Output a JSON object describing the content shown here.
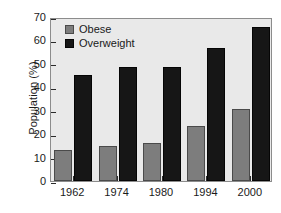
{
  "chart_data": {
    "type": "bar",
    "title": "",
    "xlabel": "",
    "ylabel": "Population (%)",
    "categories": [
      "1962",
      "1974",
      "1980",
      "1994",
      "2000"
    ],
    "series": [
      {
        "name": "Obese",
        "color": "#7d7d7d",
        "values": [
          13.4,
          15.0,
          16.3,
          23.3,
          30.9
        ]
      },
      {
        "name": "Overweight",
        "color": "#161616",
        "values": [
          45.3,
          48.6,
          48.6,
          56.7,
          65.7
        ]
      }
    ],
    "ylim": [
      0,
      70
    ],
    "yticks": [
      0,
      10,
      20,
      30,
      40,
      50,
      60,
      70
    ],
    "ytick_labels": [
      "0",
      "10",
      "20",
      "30",
      "40",
      "50",
      "60",
      "70"
    ],
    "grid": false,
    "legend_position": "top-left",
    "plot_background": "#e9e9e9",
    "frame_color": "#8c8c8c"
  }
}
